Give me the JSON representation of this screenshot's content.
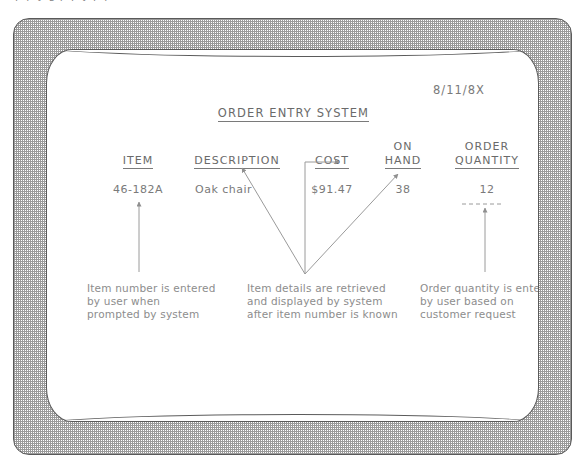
{
  "page": {
    "top_fragment_text": "a p p y  g  p  p y p p"
  },
  "screen": {
    "date": "8/11/8X",
    "title": "ORDER ENTRY SYSTEM",
    "columns": [
      {
        "id": "item",
        "head_line1": "",
        "head_line2": "ITEM",
        "value": "46-182A"
      },
      {
        "id": "desc",
        "head_line1": "",
        "head_line2": "DESCRIPTION",
        "value": "Oak chair"
      },
      {
        "id": "cost",
        "head_line1": "",
        "head_line2": "COST",
        "value": "$91.47"
      },
      {
        "id": "onhand",
        "head_line1": "ON",
        "head_line2": "HAND",
        "value": "38"
      },
      {
        "id": "orderqty",
        "head_line1": "ORDER",
        "head_line2": "QUANTITY",
        "value": "12"
      }
    ],
    "annotations": [
      {
        "id": "item-note",
        "text": "Item number is entered\nby user when\nprompted by system"
      },
      {
        "id": "details-note",
        "text": "Item details are retrieved\nand displayed by system\nafter item number is known"
      },
      {
        "id": "qty-note",
        "text": "Order quantity is entered\nby user based on\ncustomer request"
      }
    ]
  },
  "colors": {
    "ink": "#6f6f6f",
    "bezel_line": "#5a5a5a",
    "note_text": "#8d8d8d"
  }
}
